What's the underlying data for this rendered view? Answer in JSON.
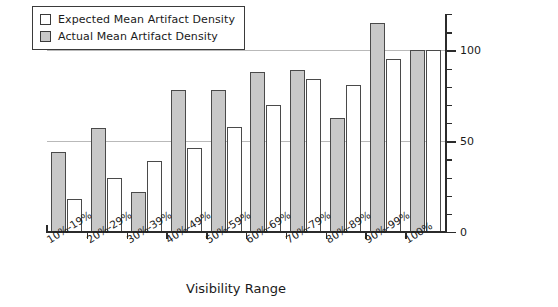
{
  "chart_data": {
    "type": "bar",
    "title": "",
    "xlabel": "Visibility Range",
    "ylabel": "Percentage of Artifact Density at 100% Visibility",
    "ylabel_line1": "Percentage of Artifact Density",
    "ylabel_line2": "at 100% Visibility",
    "categories": [
      "10%-19%",
      "20%-29%",
      "30%-39%",
      "40%-49%",
      "50%-59%",
      "60%-69%",
      "70%-79%",
      "80%-89%",
      "90%-99%",
      "100%"
    ],
    "series": [
      {
        "name": "Expected Mean Artifact Density",
        "color": "#ffffff",
        "values": [
          18,
          30,
          39,
          46,
          58,
          70,
          84,
          81,
          95,
          100
        ]
      },
      {
        "name": "Actual Mean Artifact Density",
        "color": "#c8c8c8",
        "values": [
          44,
          57,
          22,
          78,
          78,
          88,
          89,
          63,
          115,
          100
        ]
      }
    ],
    "ylim": [
      0,
      120
    ],
    "ytick_labels": [
      "0",
      "50",
      "100"
    ],
    "ytick_values": [
      0,
      50,
      100
    ],
    "yminor_step": 10,
    "grid": "horizontal-at-50-and-100",
    "legend_position": "top-left"
  },
  "legend": {
    "items": [
      {
        "label": "Expected Mean Artifact Density",
        "swatch": "white-square-icon"
      },
      {
        "label": "Actual Mean Artifact Density",
        "swatch": "gray-square-icon"
      }
    ]
  },
  "axes": {
    "x_title": "Visibility Range",
    "y_title_line1": "Percentage of Artifact Density",
    "y_title_line2": "at 100% Visibility"
  }
}
